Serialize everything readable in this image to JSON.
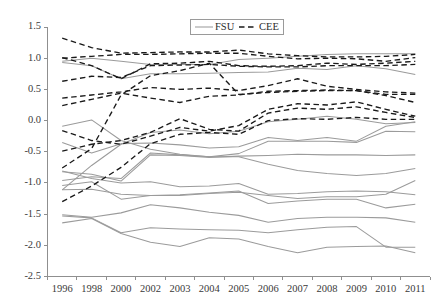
{
  "chart_data": {
    "type": "line",
    "title": "",
    "subtitle": "",
    "xlabel": "",
    "ylabel": "",
    "x": [
      "1996",
      "1998",
      "2000",
      "2002",
      "2003",
      "2004",
      "2005",
      "2006",
      "2007",
      "2008",
      "2009",
      "2010",
      "2011"
    ],
    "xtick_labels": [
      "1996",
      "1998",
      "2000",
      "2002",
      "2003",
      "2004",
      "2005",
      "2006",
      "2007",
      "2008",
      "2009",
      "2010",
      "2011"
    ],
    "ytick_labels": [
      "1.5",
      "1.0",
      "0.5",
      "0.0",
      "-0.5",
      "-1.0",
      "-1.5",
      "-2.0",
      "-2.5"
    ],
    "ytick_values": [
      1.5,
      1.0,
      0.5,
      0.0,
      -0.5,
      -1.0,
      -1.5,
      -2.0,
      -2.5
    ],
    "ylim": [
      -2.5,
      1.5
    ],
    "grid": false,
    "legend_position": "top-center",
    "legend": [
      {
        "label": "FSU",
        "style": "solid",
        "color": "#9b9b9b"
      },
      {
        "label": "CEE",
        "style": "dashed",
        "color": "#1a1a1a"
      }
    ],
    "series": [
      {
        "name": "CEE-1",
        "group": "CEE",
        "style": "dashed",
        "color": "#1a1a1a",
        "values": [
          1.32,
          1.17,
          1.08,
          1.09,
          1.1,
          1.1,
          1.13,
          1.07,
          1.04,
          1.02,
          1.02,
          1.03,
          1.06
        ]
      },
      {
        "name": "CEE-2",
        "group": "CEE",
        "style": "dashed",
        "color": "#1a1a1a",
        "values": [
          1.0,
          1.03,
          1.06,
          1.06,
          1.07,
          1.08,
          1.08,
          1.03,
          0.99,
          1.0,
          0.99,
          0.95,
          1.01
        ]
      },
      {
        "name": "CEE-3",
        "group": "CEE",
        "style": "dashed",
        "color": "#1a1a1a",
        "values": [
          1.01,
          0.88,
          0.67,
          0.91,
          0.92,
          0.95,
          0.88,
          0.87,
          0.88,
          0.92,
          0.9,
          0.92,
          0.95
        ]
      },
      {
        "name": "CEE-4",
        "group": "CEE",
        "style": "dashed",
        "color": "#1a1a1a",
        "values": [
          0.63,
          0.71,
          0.69,
          0.88,
          0.89,
          0.9,
          0.87,
          0.86,
          0.86,
          0.88,
          0.88,
          0.88,
          0.9
        ]
      },
      {
        "name": "CEE-5",
        "group": "CEE",
        "style": "dashed",
        "color": "#1a1a1a",
        "values": [
          0.36,
          0.41,
          0.46,
          0.53,
          0.5,
          0.52,
          0.48,
          0.56,
          0.67,
          0.55,
          0.5,
          0.46,
          0.44
        ]
      },
      {
        "name": "CEE-6",
        "group": "CEE",
        "style": "dashed",
        "color": "#1a1a1a",
        "values": [
          0.24,
          0.34,
          0.44,
          0.36,
          0.29,
          0.39,
          0.41,
          0.47,
          0.48,
          0.49,
          0.48,
          0.42,
          0.42
        ]
      },
      {
        "name": "CEE-7",
        "group": "CEE",
        "style": "dashed",
        "color": "#1a1a1a",
        "values": [
          -0.76,
          -0.45,
          0.41,
          0.72,
          0.8,
          0.92,
          0.42,
          0.45,
          0.47,
          0.48,
          0.48,
          0.4,
          0.29
        ]
      },
      {
        "name": "CEE-8",
        "group": "CEE",
        "style": "dashed",
        "color": "#1a1a1a",
        "values": [
          -0.16,
          -0.32,
          -0.38,
          -0.25,
          -0.11,
          -0.17,
          -0.08,
          0.18,
          0.27,
          0.25,
          0.3,
          0.18,
          0.07
        ]
      },
      {
        "name": "CEE-9",
        "group": "CEE",
        "style": "dashed",
        "color": "#1a1a1a",
        "values": [
          -0.49,
          -0.38,
          -0.32,
          -0.19,
          0.03,
          -0.14,
          -0.17,
          0.12,
          0.2,
          0.18,
          0.22,
          0.13,
          0.05
        ]
      },
      {
        "name": "CEE-10",
        "group": "CEE",
        "style": "dashed",
        "color": "#1a1a1a",
        "values": [
          -1.3,
          -1.05,
          -0.75,
          -0.37,
          -0.22,
          -0.19,
          -0.22,
          0.0,
          0.03,
          0.02,
          0.05,
          0.02,
          0.02
        ]
      },
      {
        "name": "FSU-1",
        "group": "FSU",
        "style": "solid",
        "color": "#9b9b9b",
        "values": [
          0.95,
          1.0,
          0.95,
          0.9,
          0.9,
          0.9,
          0.98,
          1.0,
          1.03,
          1.06,
          1.07,
          1.07,
          1.07
        ]
      },
      {
        "name": "FSU-2",
        "group": "FSU",
        "style": "solid",
        "color": "#9b9b9b",
        "values": [
          0.93,
          0.88,
          0.67,
          0.75,
          0.75,
          0.76,
          0.77,
          0.78,
          0.84,
          0.82,
          0.88,
          0.83,
          0.74
        ]
      },
      {
        "name": "FSU-3",
        "group": "FSU",
        "style": "solid",
        "color": "#9b9b9b",
        "values": [
          -0.09,
          0.01,
          -0.32,
          -0.46,
          -0.54,
          -0.58,
          -0.53,
          -0.33,
          -0.33,
          -0.33,
          -0.35,
          -0.17,
          -0.18
        ]
      },
      {
        "name": "FSU-4",
        "group": "FSU",
        "style": "solid",
        "color": "#9b9b9b",
        "values": [
          -0.35,
          -0.52,
          -0.37,
          -0.36,
          -0.39,
          -0.44,
          -0.42,
          -0.27,
          -0.32,
          -0.27,
          -0.33,
          -0.09,
          -0.02
        ]
      },
      {
        "name": "FSU-5",
        "group": "FSU",
        "style": "solid",
        "color": "#9b9b9b",
        "values": [
          -1.11,
          -0.72,
          -0.38,
          -0.19,
          -0.15,
          -0.21,
          -0.17,
          -0.02,
          0.02,
          0.07,
          0.02,
          -0.05,
          -0.03
        ]
      },
      {
        "name": "FSU-6",
        "group": "FSU",
        "style": "solid",
        "color": "#9b9b9b",
        "values": [
          -0.82,
          -0.86,
          -0.97,
          -0.55,
          -0.56,
          -0.59,
          -0.57,
          -0.56,
          -0.54,
          -0.55,
          -0.55,
          -0.56,
          -0.55
        ]
      },
      {
        "name": "FSU-7",
        "group": "FSU",
        "style": "solid",
        "color": "#9b9b9b",
        "values": [
          -0.96,
          -0.9,
          -0.93,
          -0.52,
          -0.55,
          -0.58,
          -0.58,
          -0.7,
          -0.8,
          -0.85,
          -0.88,
          -0.85,
          -0.77
        ]
      },
      {
        "name": "FSU-8",
        "group": "FSU",
        "style": "solid",
        "color": "#9b9b9b",
        "values": [
          -0.81,
          -0.93,
          -1.0,
          -0.98,
          -1.06,
          -1.05,
          -1.01,
          -1.18,
          -1.17,
          -1.14,
          -1.13,
          -1.14,
          -1.19
        ]
      },
      {
        "name": "FSU-9",
        "group": "FSU",
        "style": "solid",
        "color": "#9b9b9b",
        "values": [
          -1.04,
          -0.98,
          -1.26,
          -1.2,
          -1.19,
          -1.16,
          -1.13,
          -1.33,
          -1.29,
          -1.26,
          -1.26,
          -1.4,
          -1.34
        ]
      },
      {
        "name": "FSU-10",
        "group": "FSU",
        "style": "solid",
        "color": "#9b9b9b",
        "values": [
          -1.11,
          -1.1,
          -1.18,
          -1.2,
          -1.2,
          -1.17,
          -1.15,
          -1.2,
          -1.25,
          -1.22,
          -1.22,
          -1.18,
          -0.96
        ]
      },
      {
        "name": "FSU-11",
        "group": "FSU",
        "style": "solid",
        "color": "#9b9b9b",
        "values": [
          -1.51,
          -1.55,
          -1.48,
          -1.35,
          -1.4,
          -1.47,
          -1.52,
          -1.63,
          -1.57,
          -1.55,
          -1.55,
          -1.56,
          -1.63
        ]
      },
      {
        "name": "FSU-12",
        "group": "FSU",
        "style": "solid",
        "color": "#9b9b9b",
        "values": [
          -1.64,
          -1.57,
          -1.81,
          -1.95,
          -2.02,
          -1.88,
          -1.9,
          -2.02,
          -2.12,
          -2.03,
          -2.02,
          -2.01,
          -2.12
        ]
      },
      {
        "name": "FSU-13",
        "group": "FSU",
        "style": "solid",
        "color": "#9b9b9b",
        "values": [
          -1.53,
          -1.56,
          -1.8,
          -1.72,
          -1.74,
          -1.75,
          -1.76,
          -1.8,
          -1.75,
          -1.71,
          -1.7,
          -2.03,
          -2.03
        ]
      }
    ]
  },
  "colors": {
    "fsu": "#9b9b9b",
    "cee": "#1a1a1a",
    "axis": "#8f8f8f",
    "tick_text": "#3a3a3a",
    "background": "#ffffff"
  }
}
